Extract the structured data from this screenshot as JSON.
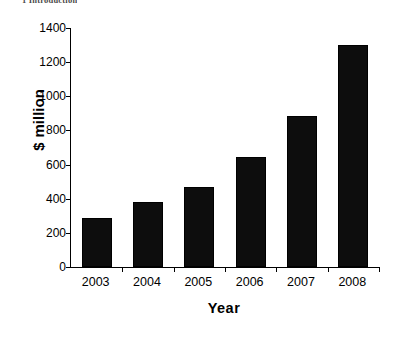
{
  "page": {
    "partial_heading": "1 Introduction"
  },
  "chart_data": {
    "type": "bar",
    "title": "",
    "categories": [
      "2003",
      "2004",
      "2005",
      "2006",
      "2007",
      "2008"
    ],
    "values": [
      287,
      381,
      469,
      644,
      885,
      1300
    ],
    "series": [
      {
        "name": "",
        "values": [
          287,
          381,
          469,
          644,
          885,
          1300
        ]
      }
    ],
    "xlabel": "Year",
    "ylabel": "$ million",
    "ylabel_parts": {
      "currency": "$",
      "unit": "million"
    },
    "ylim": [
      0,
      1400
    ],
    "yticks": [
      0,
      200,
      400,
      600,
      800,
      1000,
      1200,
      1400
    ],
    "ytick_labels": [
      "0",
      "200",
      "400",
      "600",
      "800",
      "1000",
      "1200",
      "1400"
    ],
    "grid": false,
    "legend": null,
    "bar_color": "#0d0d0d",
    "axis_color": "#000000",
    "background": "#ffffff"
  }
}
